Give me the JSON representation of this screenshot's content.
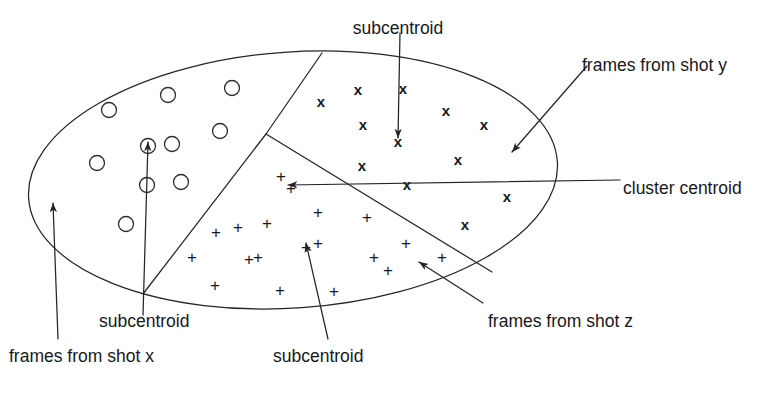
{
  "figure": {
    "kind": "cluster-diagram",
    "stroke_color": "#23252b",
    "background_color": "#ffffff",
    "labels": [
      {
        "id": "subcentroid-top",
        "text": "subcentroid",
        "x": 398,
        "y": 20,
        "anchor": "middle"
      },
      {
        "id": "frames-from-shot-y",
        "text": "frames from shot y",
        "x": 582,
        "y": 57,
        "anchor": "start"
      },
      {
        "id": "cluster-centroid",
        "text": "cluster centroid",
        "x": 623,
        "y": 180,
        "anchor": "start"
      },
      {
        "id": "frames-from-shot-z",
        "text": "frames from shot z",
        "x": 488,
        "y": 313,
        "anchor": "start"
      },
      {
        "id": "subcentroid-left",
        "text": "subcentroid",
        "x": 99,
        "y": 313,
        "anchor": "start"
      },
      {
        "id": "frames-from-shot-x",
        "text": "frames from shot x",
        "x": 9,
        "y": 348,
        "anchor": "start"
      },
      {
        "id": "subcentroid-bottom",
        "text": "subcentroid",
        "x": 273,
        "y": 348,
        "anchor": "start"
      }
    ],
    "ellipse": {
      "cx": 293,
      "cy": 180,
      "rx": 265,
      "ry": 128,
      "rotation": -4
    },
    "dividers": [
      {
        "id": "divider-upper",
        "x1": 322,
        "y1": 53,
        "x2": 266,
        "y2": 134
      },
      {
        "id": "divider-lower-left",
        "x1": 266,
        "y1": 134,
        "x2": 143,
        "y2": 294
      },
      {
        "id": "divider-lower-right",
        "x1": 266,
        "y1": 134,
        "x2": 492,
        "y2": 272
      }
    ],
    "leaders": [
      {
        "id": "leader-subcentroid-top",
        "x1": 400,
        "y1": 33,
        "x2": 398,
        "y2": 138,
        "arrow": "end"
      },
      {
        "id": "leader-frames-shot-y",
        "x1": 587,
        "y1": 66,
        "x2": 512,
        "y2": 152,
        "arrow": "end"
      },
      {
        "id": "leader-cluster-centroid",
        "x1": 620,
        "y1": 180,
        "x2": 288,
        "y2": 185,
        "arrow": "end"
      },
      {
        "id": "leader-frames-shot-z",
        "x1": 483,
        "y1": 303,
        "x2": 419,
        "y2": 262,
        "arrow": "end"
      },
      {
        "id": "leader-subcentroid-left",
        "x1": 143,
        "y1": 315,
        "x2": 148,
        "y2": 142,
        "arrow": "end"
      },
      {
        "id": "leader-frames-shot-x",
        "x1": 58,
        "y1": 339,
        "x2": 53,
        "y2": 203,
        "arrow": "end"
      },
      {
        "id": "leader-subcentroid-bottom",
        "x1": 328,
        "y1": 339,
        "x2": 306,
        "y2": 243,
        "arrow": "end"
      }
    ],
    "markers": {
      "circle": {
        "glyph_name": "circle-marker",
        "legend": "frames from shot x",
        "radius": 7.5,
        "points": [
          [
            109,
            110
          ],
          [
            168,
            95
          ],
          [
            232,
            88
          ],
          [
            97,
            163
          ],
          [
            148,
            146
          ],
          [
            172,
            144
          ],
          [
            220,
            131
          ],
          [
            147,
            185
          ],
          [
            181,
            182
          ],
          [
            126,
            224
          ]
        ]
      },
      "x": {
        "glyph_name": "x-marker",
        "legend": "frames from shot y",
        "points": [
          [
            321,
            101
          ],
          [
            358,
            89
          ],
          [
            403,
            88
          ],
          [
            363,
            124
          ],
          [
            446,
            110
          ],
          [
            398,
            141
          ],
          [
            484,
            124
          ],
          [
            362,
            165
          ],
          [
            458,
            159
          ],
          [
            407,
            184
          ],
          [
            507,
            196
          ],
          [
            465,
            224
          ]
        ]
      },
      "plus": {
        "glyph_name": "plus-marker",
        "legend": "frames from shot z",
        "points": [
          [
            281,
            176
          ],
          [
            291,
            188
          ],
          [
            238,
            227
          ],
          [
            267,
            223
          ],
          [
            318,
            212
          ],
          [
            367,
            217
          ],
          [
            216,
            232
          ],
          [
            406,
            243
          ],
          [
            192,
            257
          ],
          [
            258,
            257
          ],
          [
            306,
            247
          ],
          [
            318,
            243
          ],
          [
            374,
            257
          ],
          [
            215,
            285
          ],
          [
            280,
            290
          ],
          [
            334,
            291
          ],
          [
            388,
            270
          ],
          [
            249,
            259
          ],
          [
            442,
            257
          ]
        ]
      }
    }
  }
}
